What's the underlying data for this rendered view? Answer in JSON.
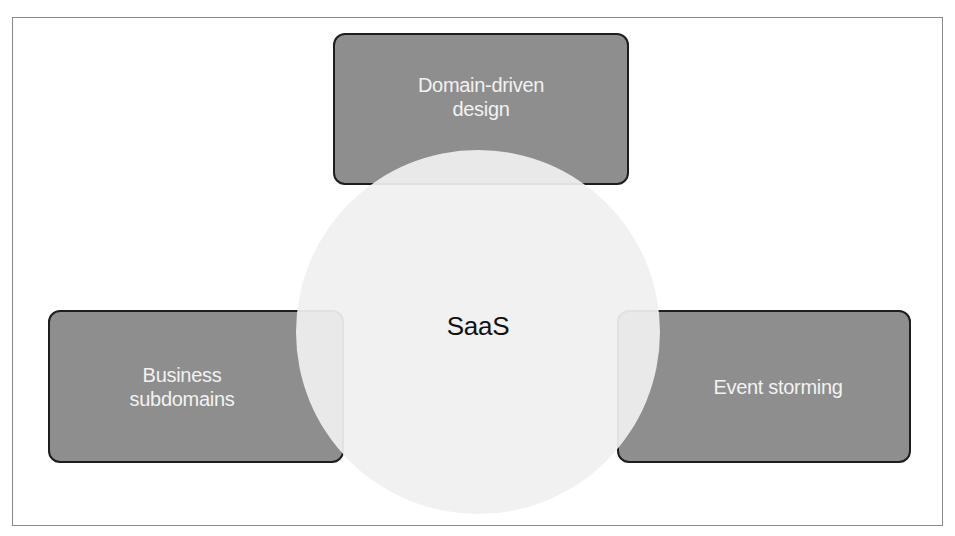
{
  "diagram": {
    "type": "venn-style concept diagram",
    "center": {
      "label": "SaaS",
      "shape": "circle",
      "fill": "#f0f0f0"
    },
    "nodes": [
      {
        "id": "top",
        "label_line1": "Domain-driven",
        "label_line2": "design",
        "position": "top"
      },
      {
        "id": "left",
        "label_line1": "Business",
        "label_line2": "subdomains",
        "position": "bottom-left"
      },
      {
        "id": "right",
        "label_line1": "Event storming",
        "label_line2": "",
        "position": "bottom-right"
      }
    ],
    "colors": {
      "box_fill": "#8e8e8e",
      "box_border": "#1e1e1e",
      "box_text": "#f2f2f2",
      "center_text": "#111111",
      "frame_border": "#8a8a8a"
    }
  }
}
